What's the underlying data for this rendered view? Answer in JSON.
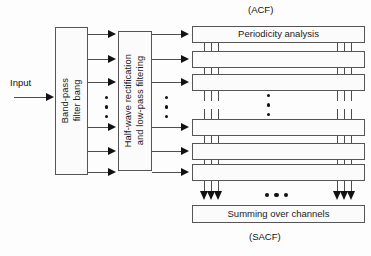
{
  "figure": {
    "title_top": "(ACF)",
    "title_bottom": "(SACF)",
    "input_label": "Input"
  },
  "stages": {
    "filterbank": {
      "label": "Band-pass\nfilter bang",
      "line1": "Band-pass",
      "line2": "filter bang"
    },
    "rectifier": {
      "label": "Half-wave rectification\nand low-pass filtering",
      "line1": "Half-wave rectification",
      "line2": "and low-pass filtering"
    },
    "periodicity": {
      "label": "Periodicity analysis"
    },
    "summing": {
      "label": "Summing over channels"
    }
  },
  "channels": {
    "count_visible": 6,
    "top_group": 3,
    "bottom_group": 3,
    "ellipsis_glyph": "⋮",
    "ellipsis_h_glyph": "…"
  },
  "acf_rows": [
    {
      "label": "Periodicity analysis",
      "labeled": true
    },
    {
      "label": "",
      "labeled": false
    },
    {
      "label": "",
      "labeled": false
    },
    {
      "label": "",
      "labeled": false
    },
    {
      "label": "",
      "labeled": false
    },
    {
      "label": "",
      "labeled": false
    }
  ],
  "colors": {
    "stroke": "#4d4d4d",
    "box_border": "#555555",
    "box_fill": "#fbfbfb",
    "arrow": "#111111",
    "text": "#111111",
    "background": "#fdfdfd"
  }
}
